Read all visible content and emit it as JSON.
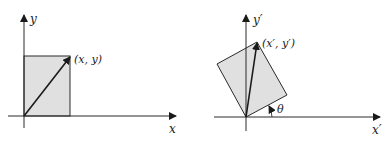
{
  "colors": {
    "line": "#2a2a2a",
    "fill": "#e0e0e0",
    "background": "#ffffff"
  },
  "left_diagram": {
    "x_axis_label": "x",
    "y_axis_label": "y",
    "point_label": "(x, y)"
  },
  "right_diagram": {
    "x_axis_label": "x′",
    "y_axis_label": "y′",
    "point_label": "(x′, y′)",
    "angle_label": "θ"
  }
}
